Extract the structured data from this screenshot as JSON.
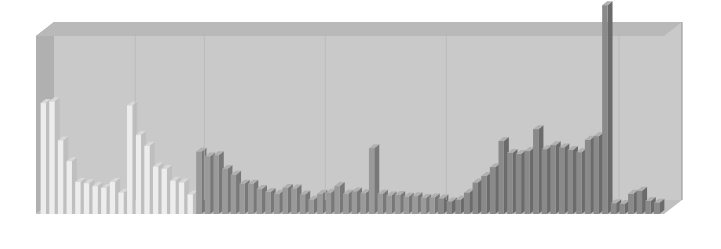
{
  "axis": {
    "right_title": "Population",
    "right_subtitle": "(millions)",
    "ticks": [
      "0",
      "5",
      "10",
      "15",
      "20",
      "25",
      "30"
    ],
    "tick_values": [
      0,
      5,
      10,
      15,
      20,
      25,
      30
    ]
  },
  "colors": {
    "panel": "#c9c9c9",
    "panel_top": "#b9b9b9",
    "panel_left": "#b0b0b0",
    "bar_light": "#ededed",
    "bar_light_side": "#bfbfbf",
    "bar_light_top": "#d8d8d8",
    "bar_mid": "#9a9a9a",
    "bar_mid_side": "#787878",
    "bar_mid_top": "#b0b0b0",
    "bar_dark": "#8a8a8a",
    "bar_dark_side": "#6b6b6b",
    "text": "#1d2228"
  },
  "callouts": [
    {
      "city": "Mexico City",
      "value": "19 013 000",
      "series": 0,
      "index": 1
    },
    {
      "city": "São Paulo",
      "value": "18 333 000",
      "series": 1,
      "index": 0
    },
    {
      "city": "Paris",
      "value": "9 854 000",
      "series": 2,
      "index": 2
    },
    {
      "city": "Cairo",
      "value": "11 146 000",
      "series": 3,
      "index": 6
    },
    {
      "city": "Sydney",
      "value": "3 907 000",
      "series": 5,
      "index": 3
    }
  ],
  "chart_data": {
    "type": "bar",
    "xlabel": "",
    "ylabel": "Population (millions)",
    "ylim": [
      0,
      30
    ],
    "grid": false,
    "legend": "none",
    "units": "millions of people",
    "groups": [
      {
        "name": "North America",
        "shade": "light",
        "categories": [
          "New York",
          "Mexico City",
          "Los Angeles",
          "Chicago",
          "Philadelphia",
          "Toronto",
          "Houston",
          "Dallas",
          "Miami",
          "Montreal"
        ],
        "values": [
          18.7,
          19.0,
          12.4,
          8.9,
          5.4,
          5.2,
          4.7,
          4.4,
          5.4,
          3.6
        ]
      },
      {
        "name": "South America",
        "shade": "light",
        "categories": [
          "São Paulo",
          "Buenos Aires",
          "Rio de Janeiro",
          "Lima",
          "Bogotá",
          "Santiago",
          "Belo Horizonte",
          "Caracas"
        ],
        "values": [
          18.3,
          13.3,
          11.5,
          8.0,
          7.6,
          5.6,
          5.3,
          3.3
        ]
      },
      {
        "name": "Europe",
        "shade": "mid",
        "categories": [
          "Moscow",
          "Istanbul",
          "Paris",
          "London",
          "Essen",
          "Madrid",
          "St Petersburg",
          "Berlin",
          "Rome",
          "Athens",
          "Barcelona",
          "Milan",
          "Lisbon",
          "Birmingham"
        ],
        "values": [
          10.5,
          9.7,
          9.9,
          7.6,
          6.6,
          5.1,
          5.1,
          4.2,
          3.7,
          3.4,
          4.4,
          4.3,
          3.3,
          2.4
        ]
      },
      {
        "name": "Africa",
        "shade": "mid",
        "categories": [
          "Lagos",
          "Kinshasa",
          "Khartoum",
          "Algiers",
          "Alexandria",
          "Casablanca",
          "Cairo",
          "Abidjan",
          "Cape Town",
          "Johannesburg",
          "Nairobi",
          "Addis Ababa",
          "Dar es Salaam",
          "Durban"
        ],
        "values": [
          3.4,
          3.6,
          4.7,
          3.4,
          3.8,
          3.5,
          11.1,
          3.4,
          3.1,
          3.2,
          2.9,
          3.0,
          2.7,
          2.8
        ]
      },
      {
        "name": "Asia",
        "shade": "dark",
        "categories": [
          "Karachi",
          "Tehran",
          "Bangkok",
          "Hong Kong",
          "Shanghai",
          "Beijing",
          "Jakarta",
          "Osaka",
          "Manila",
          "Seoul",
          "Delhi",
          "Kolkata",
          "Mumbai",
          "Dhaka",
          "Tianjin",
          "Chennai",
          "Bangalore",
          "Shenyang",
          "Lahore",
          "Tokyo"
        ],
        "values": [
          2.6,
          2.1,
          2.4,
          3.6,
          5.3,
          6.4,
          7.9,
          12.3,
          10.3,
          10.1,
          10.6,
          14.3,
          10.9,
          11.6,
          11.2,
          10.8,
          10.4,
          12.5,
          13.1,
          35.2
        ]
      },
      {
        "name": "Oceania",
        "shade": "dark",
        "categories": [
          "Brisbane",
          "Adelaide",
          "Melbourne",
          "Sydney",
          "Perth",
          "Auckland"
        ],
        "values": [
          1.8,
          1.7,
          3.4,
          3.9,
          2.2,
          1.9
        ]
      }
    ]
  }
}
